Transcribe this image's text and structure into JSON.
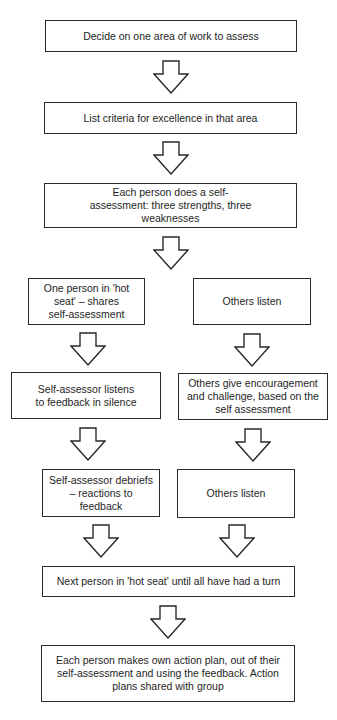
{
  "diagram": {
    "type": "flowchart",
    "colors": {
      "stroke": "#2a2a2a",
      "background": "#ffffff",
      "text": "#1e1e1e"
    },
    "nodes": {
      "step1": {
        "label": "Decide on one area of work to assess"
      },
      "step2": {
        "label": "List criteria for excellence in that area"
      },
      "step3": {
        "label": "Each person does a self-assessment: three strengths, three weaknesses"
      },
      "left1": {
        "label": "One person in 'hot seat' – shares self-assessment"
      },
      "right1": {
        "label": "Others listen"
      },
      "left2": {
        "label": "Self-assessor listens to feedback in silence"
      },
      "right2": {
        "label": "Others give encouragement and challenge, based on the self assessment"
      },
      "left3": {
        "label": "Self-assessor debriefs – reactions to feedback"
      },
      "right3": {
        "label": "Others listen"
      },
      "step4": {
        "label": "Next person in 'hot seat' until all have had a turn"
      },
      "step5": {
        "label": "Each person makes own action plan, out of their self-assessment and using the feedback. Action plans shared with group"
      }
    },
    "edges": [
      [
        "step1",
        "step2"
      ],
      [
        "step2",
        "step3"
      ],
      [
        "step3",
        "left1/right1"
      ],
      [
        "left1",
        "left2"
      ],
      [
        "right1",
        "right2"
      ],
      [
        "left2",
        "left3"
      ],
      [
        "right2",
        "right3"
      ],
      [
        "left3",
        "step4"
      ],
      [
        "right3",
        "step4"
      ],
      [
        "step4",
        "step5"
      ]
    ]
  }
}
